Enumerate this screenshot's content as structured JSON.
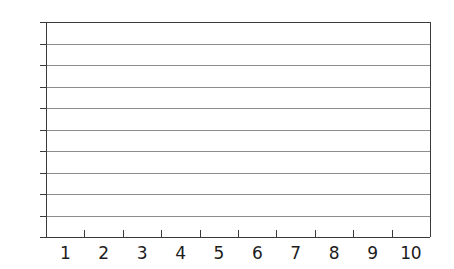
{
  "chart_data": {
    "type": "line",
    "title": "",
    "subtitle": "",
    "xlabel": "",
    "ylabel": "",
    "series": [],
    "x": [],
    "categories": [],
    "values": [],
    "xlim": [
      0,
      10
    ],
    "ylim": [
      0,
      10
    ],
    "x_tick_labels": [
      "1",
      "2",
      "3",
      "4",
      "5",
      "6",
      "7",
      "8",
      "9",
      "10"
    ],
    "y_tick_labels": [
      "0",
      "1",
      "2",
      "3",
      "4",
      "5",
      "6",
      "7",
      "8",
      "9",
      "10"
    ],
    "grid": true,
    "grid_orientation": "horizontal",
    "legend": "none",
    "annotations": [],
    "note": "Empty 10x10 plotting grid with no plotted data",
    "colors": {
      "background": "#ffffff",
      "grid_line": "#8d8d8d",
      "axis_line": "#3a3a3a",
      "label_text": "#1c1c1c"
    }
  },
  "axes": {
    "y": {
      "name": "y-axis",
      "ticks": [
        {
          "label": "10",
          "value": 10
        },
        {
          "label": "9",
          "value": 9
        },
        {
          "label": "8",
          "value": 8
        },
        {
          "label": "7",
          "value": 7
        },
        {
          "label": "6",
          "value": 6
        },
        {
          "label": "5",
          "value": 5
        },
        {
          "label": "4",
          "value": 4
        },
        {
          "label": "3",
          "value": 3
        },
        {
          "label": "2",
          "value": 2
        },
        {
          "label": "1",
          "value": 1
        },
        {
          "label": "0",
          "value": 0
        }
      ]
    },
    "x": {
      "name": "x-axis",
      "ticks": [
        {
          "label": "1",
          "value": 1
        },
        {
          "label": "2",
          "value": 2
        },
        {
          "label": "3",
          "value": 3
        },
        {
          "label": "4",
          "value": 4
        },
        {
          "label": "5",
          "value": 5
        },
        {
          "label": "6",
          "value": 6
        },
        {
          "label": "7",
          "value": 7
        },
        {
          "label": "8",
          "value": 8
        },
        {
          "label": "9",
          "value": 9
        },
        {
          "label": "10",
          "value": 10
        }
      ]
    }
  }
}
